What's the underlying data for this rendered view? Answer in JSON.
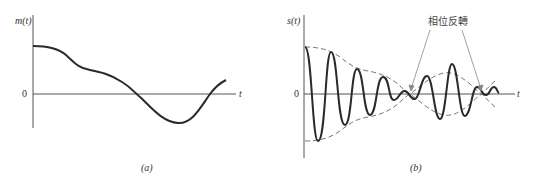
{
  "panel_a": {
    "y_label": "m(t)",
    "x_label": "t",
    "zero_label": "0",
    "caption": "(a)"
  },
  "panel_b": {
    "y_label": "s(t)",
    "x_label": "t",
    "zero_label": "0",
    "caption": "(b)",
    "annotation": "相位反轉"
  },
  "colors": {
    "curve": "#2a2a2a",
    "axis": "#555555",
    "envelope": "#777777",
    "arrow": "#888888"
  }
}
